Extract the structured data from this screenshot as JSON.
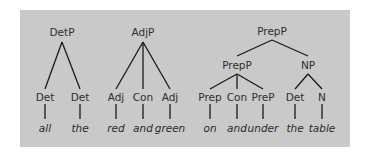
{
  "colors": {
    "panel_bg": "#c9c9c9",
    "line": "#1a1a1a",
    "text": "#2e2e2e"
  },
  "trees": [
    {
      "root": "DetP",
      "children": [
        {
          "label": "Det",
          "word": "all"
        },
        {
          "label": "Det",
          "word": "the"
        }
      ]
    },
    {
      "root": "AdjP",
      "children": [
        {
          "label": "Adj",
          "word": "red"
        },
        {
          "label": "Con",
          "word": "and"
        },
        {
          "label": "Adj",
          "word": "green"
        }
      ]
    },
    {
      "root": "PrepP",
      "subtrees": [
        {
          "label": "PrepP",
          "children": [
            {
              "label": "Prep",
              "word": "on"
            },
            {
              "label": "Con",
              "word": "and"
            },
            {
              "label": "PreP",
              "word": "under"
            }
          ]
        },
        {
          "label": "NP",
          "children": [
            {
              "label": "Det",
              "word": "the"
            },
            {
              "label": "N",
              "word": "table"
            }
          ]
        }
      ]
    }
  ]
}
